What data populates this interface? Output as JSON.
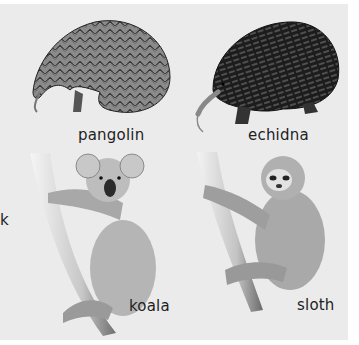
{
  "figure": {
    "stray_text": "k",
    "animals": [
      {
        "name": "pangolin",
        "label": "pangolin"
      },
      {
        "name": "echidna",
        "label": "echidna"
      },
      {
        "name": "koala",
        "label": "koala"
      },
      {
        "name": "sloth",
        "label": "sloth"
      }
    ],
    "colors": {
      "background": "#ffffff",
      "panel": "#ebebeb",
      "text": "#1e1e1e"
    }
  }
}
